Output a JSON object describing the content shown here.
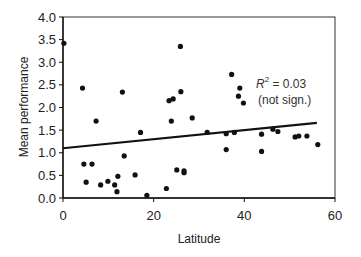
{
  "chart_data": {
    "type": "scatter",
    "title": "",
    "xlabel": "Latitude",
    "ylabel": "Mean performance",
    "xlim": [
      0,
      60
    ],
    "ylim": [
      0.0,
      4.0
    ],
    "xticks": [
      0,
      20,
      40,
      60
    ],
    "xtick_labels": [
      "0",
      "20",
      "40",
      "60"
    ],
    "yticks": [
      0.0,
      0.5,
      1.0,
      1.5,
      2.0,
      2.5,
      3.0,
      3.5,
      4.0
    ],
    "ytick_labels": [
      "0.0",
      "0.5",
      "1.0",
      "1.5",
      "2.0",
      "2.5",
      "3.0",
      "3.5",
      "4.0"
    ],
    "grid": false,
    "legend": null,
    "series": [
      {
        "name": "observations",
        "points": [
          {
            "x": 0.2,
            "y": 3.42
          },
          {
            "x": 4.3,
            "y": 2.43
          },
          {
            "x": 4.6,
            "y": 0.75
          },
          {
            "x": 5.1,
            "y": 0.35
          },
          {
            "x": 6.4,
            "y": 0.75
          },
          {
            "x": 7.3,
            "y": 1.7
          },
          {
            "x": 8.3,
            "y": 0.29
          },
          {
            "x": 9.9,
            "y": 0.37
          },
          {
            "x": 11.4,
            "y": 0.29
          },
          {
            "x": 11.9,
            "y": 0.14
          },
          {
            "x": 12.1,
            "y": 0.48
          },
          {
            "x": 13.1,
            "y": 2.34
          },
          {
            "x": 13.5,
            "y": 0.93
          },
          {
            "x": 15.9,
            "y": 0.51
          },
          {
            "x": 17.1,
            "y": 1.45
          },
          {
            "x": 18.5,
            "y": 0.06
          },
          {
            "x": 22.8,
            "y": 0.21
          },
          {
            "x": 23.4,
            "y": 2.15
          },
          {
            "x": 23.9,
            "y": 1.7
          },
          {
            "x": 24.3,
            "y": 2.19
          },
          {
            "x": 25.1,
            "y": 0.62
          },
          {
            "x": 25.9,
            "y": 3.35
          },
          {
            "x": 26.0,
            "y": 2.35
          },
          {
            "x": 26.7,
            "y": 0.56
          },
          {
            "x": 26.7,
            "y": 0.6
          },
          {
            "x": 28.5,
            "y": 1.77
          },
          {
            "x": 31.8,
            "y": 1.45
          },
          {
            "x": 36.0,
            "y": 1.42
          },
          {
            "x": 36.0,
            "y": 1.07
          },
          {
            "x": 37.2,
            "y": 2.73
          },
          {
            "x": 37.8,
            "y": 1.45
          },
          {
            "x": 39.0,
            "y": 2.43
          },
          {
            "x": 38.7,
            "y": 2.25
          },
          {
            "x": 39.8,
            "y": 2.1
          },
          {
            "x": 43.8,
            "y": 1.41
          },
          {
            "x": 43.8,
            "y": 1.03
          },
          {
            "x": 46.3,
            "y": 1.52
          },
          {
            "x": 47.4,
            "y": 1.47
          },
          {
            "x": 51.2,
            "y": 1.35
          },
          {
            "x": 52.0,
            "y": 1.37
          },
          {
            "x": 53.8,
            "y": 1.37
          },
          {
            "x": 56.2,
            "y": 1.18
          }
        ]
      }
    ],
    "trendline": {
      "type": "linear",
      "x_start": 0,
      "y_start": 1.1,
      "x_end": 56,
      "y_end": 1.66
    },
    "annotations": [
      {
        "text_main": "R",
        "superscript": "2",
        "text_rest": " = 0.03",
        "x": 46,
        "y": 2.55
      },
      {
        "text": "(not sign.)",
        "x": 46,
        "y": 2.18
      }
    ]
  },
  "labels": {
    "xlabel": "Latitude",
    "ylabel": "Mean performance",
    "r2_symbol": "R",
    "r2_sup": "2",
    "r2_value": " = 0.03",
    "significance": "(not sign.)"
  }
}
